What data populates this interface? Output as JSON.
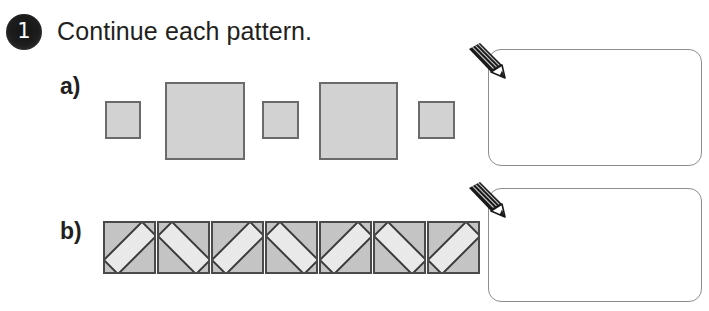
{
  "worksheet": {
    "question_number": "1",
    "instruction": "Continue each pattern."
  },
  "parts": [
    {
      "label": "a)",
      "pattern_type": "alternating-square-sizes",
      "items": [
        {
          "shape": "square",
          "size": "small"
        },
        {
          "shape": "square",
          "size": "large"
        },
        {
          "shape": "square",
          "size": "small"
        },
        {
          "shape": "square",
          "size": "large"
        },
        {
          "shape": "square",
          "size": "small"
        }
      ],
      "answer_placeholder": ""
    },
    {
      "label": "b)",
      "pattern_type": "alternating-bar-rotation",
      "items": [
        {
          "shape": "tile",
          "rotation": "ccw"
        },
        {
          "shape": "tile",
          "rotation": "cw"
        },
        {
          "shape": "tile",
          "rotation": "ccw"
        },
        {
          "shape": "tile",
          "rotation": "cw"
        },
        {
          "shape": "tile",
          "rotation": "ccw"
        },
        {
          "shape": "tile",
          "rotation": "cw"
        },
        {
          "shape": "tile",
          "rotation": "ccw"
        }
      ],
      "answer_placeholder": ""
    }
  ],
  "icons": {
    "pencil": "pencil-icon",
    "badge": "question-number-badge"
  },
  "colors": {
    "square_fill": "#d2d2d2",
    "square_border": "#6b6b6b",
    "tile_fill": "#c4c4c4",
    "tile_border": "#4a4a4a",
    "bar_fill": "#e9e9e9",
    "bar_border": "#3a3a3a",
    "answer_box_border": "#8d8d8d",
    "text": "#231f20",
    "badge_bg": "#1d1d1d",
    "badge_text": "#ffffff",
    "pencil_body": "#1a1a1a"
  }
}
